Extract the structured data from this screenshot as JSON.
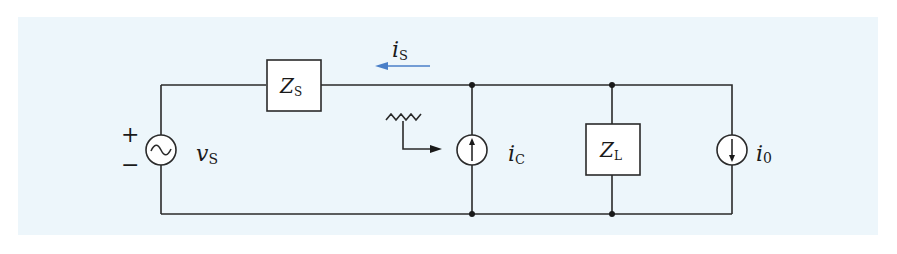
{
  "diagram": {
    "title": "",
    "colors": {
      "background": "#edf6fb",
      "wire": "#2a2a2a",
      "current_arrow": "#4a7fc8"
    },
    "source": {
      "symbol": "ac-voltage-source",
      "label_main": "v",
      "label_sub": "S",
      "plus": "+",
      "minus": "−"
    },
    "source_impedance": {
      "label_main": "Z",
      "label_sub": "S"
    },
    "source_current": {
      "label_main": "i",
      "label_sub": "S",
      "direction": "left"
    },
    "compensator_current": {
      "label_main": "i",
      "label_sub": "C",
      "direction": "up"
    },
    "load_impedance": {
      "label_main": "Z",
      "label_sub": "L"
    },
    "load_current": {
      "label_main": "i",
      "label_sub": "0",
      "direction": "down"
    },
    "control_symbol": "sawtooth-waveform-with-arrow"
  }
}
